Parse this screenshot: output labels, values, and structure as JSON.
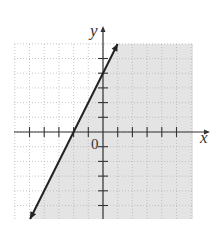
{
  "chart_data": {
    "type": "line",
    "title": "",
    "inequality": "y <= 2x + 4",
    "boundary_line": {
      "slope": 2,
      "intercept": 4,
      "style": "solid",
      "arrows": "both"
    },
    "shaded_region": "below/right of line",
    "points_on_line": [
      {
        "x": -2,
        "y": 0
      },
      {
        "x": 0,
        "y": 4
      }
    ],
    "xlabel": "x",
    "ylabel": "y",
    "origin_label": "0",
    "xlim": [
      -6,
      6
    ],
    "ylim": [
      -6,
      6
    ],
    "grid": true,
    "tick_spacing": 1
  },
  "labels": {
    "x_axis": "x",
    "y_axis": "y",
    "origin": "0"
  },
  "colors": {
    "shade": "#e4e4e4",
    "grid": "#b0b0b0",
    "axis": "#333333",
    "line": "#222222"
  }
}
